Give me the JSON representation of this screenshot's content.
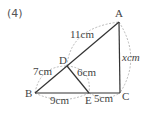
{
  "problem": {
    "number": "(4)"
  },
  "vertices": {
    "A": "A",
    "B": "B",
    "C": "C",
    "D": "D",
    "E": "E"
  },
  "measurements": {
    "AD": "11cm",
    "DB": "7cm",
    "DE": "6cm",
    "BE": "9cm",
    "EC": "5cm",
    "AC": "xcm"
  },
  "colors": {
    "edge": "#333333",
    "arc": "#a8a8a8",
    "text": "#444444"
  }
}
